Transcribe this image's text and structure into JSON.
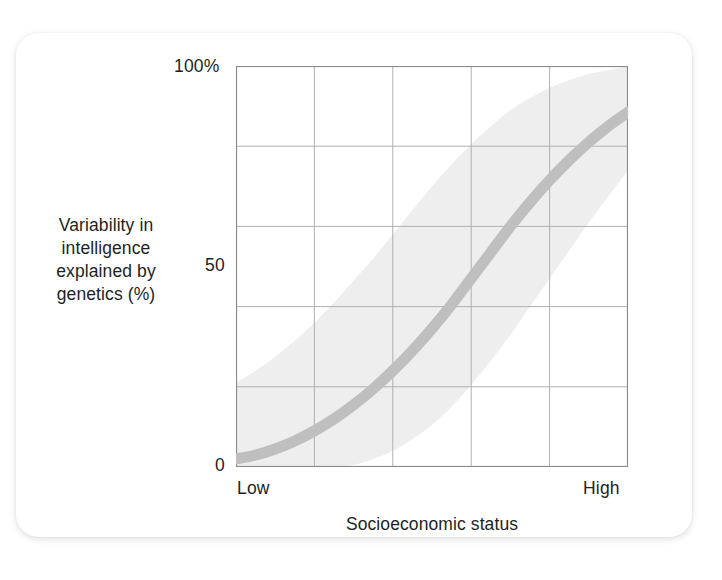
{
  "figure": {
    "background_color": "#ffffff",
    "card_color": "#ffffff",
    "axis_color": "#8a8a8a",
    "grid_color": "#b0b0b0",
    "text_color": "#221f1f"
  },
  "axis": {
    "y_title_line1": "Variability in",
    "y_title_line2": "intelligence",
    "y_title_line3": "explained by",
    "y_title_line4": "genetics (%)",
    "x_title": "Socioeconomic status",
    "y_tick_top": "100%",
    "y_tick_mid": "50",
    "y_tick_bottom": "0",
    "x_tick_left": "Low",
    "x_tick_right": "High"
  },
  "chart_data": {
    "type": "line",
    "title": "",
    "subtitle": "",
    "xlabel": "Socioeconomic status",
    "ylabel": "Variability in intelligence explained by genetics (%)",
    "xlim": [
      0,
      100
    ],
    "ylim": [
      0,
      100
    ],
    "x_tick_labels": [
      "Low",
      "High"
    ],
    "y_tick_labels": [
      "0",
      "50",
      "100%"
    ],
    "y_ticks": [
      0,
      50,
      100
    ],
    "grid": true,
    "grid_x_positions": [
      0,
      20,
      40,
      60,
      80,
      100
    ],
    "grid_y_positions": [
      0,
      20,
      40,
      60,
      80,
      100
    ],
    "legend": "none",
    "line_color": "#bfbfbf",
    "band_color": "#eeeeee",
    "line_width_px": 11,
    "x": [
      0,
      5,
      10,
      15,
      20,
      25,
      30,
      35,
      40,
      45,
      50,
      55,
      60,
      65,
      70,
      75,
      80,
      85,
      90,
      95,
      100
    ],
    "series": [
      {
        "name": "Heritability of intelligence",
        "values": [
          2,
          3,
          4.5,
          6.5,
          9,
          12,
          15.5,
          19.5,
          24,
          29,
          34.5,
          40.5,
          47,
          53.5,
          60,
          66,
          71.5,
          76.5,
          81,
          85,
          88.5
        ]
      },
      {
        "name": "Upper confidence bound",
        "values": [
          21,
          24,
          27.5,
          31.5,
          36,
          41,
          46.5,
          52,
          58,
          64,
          70,
          75.5,
          80.5,
          85,
          89,
          92,
          94.5,
          96.5,
          98,
          99,
          100
        ]
      },
      {
        "name": "Lower confidence bound",
        "values": [
          0,
          0,
          0,
          0,
          0,
          0,
          0.5,
          2,
          4,
          7,
          10.5,
          15,
          20.5,
          26.5,
          33,
          40,
          47,
          54,
          61,
          67.5,
          74
        ]
      }
    ],
    "annotations": []
  }
}
